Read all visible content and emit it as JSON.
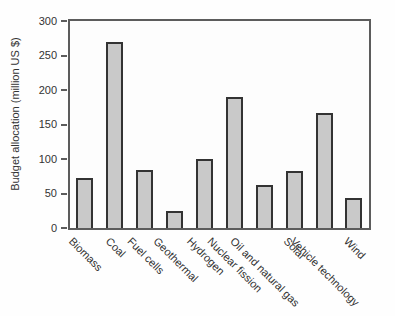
{
  "chart_data": {
    "type": "bar",
    "categories": [
      "Biomass",
      "Coal",
      "Fuel cells",
      "Geothermal",
      "Hydrogen",
      "Nuclear fission",
      "Oil and natural gas",
      "Solar",
      "Vehicle technology",
      "Wind"
    ],
    "values": [
      73,
      270,
      84,
      24,
      100,
      190,
      62,
      83,
      166,
      44
    ],
    "title": "",
    "xlabel": "",
    "ylabel": "Budget allocation (million US $)",
    "ylim": [
      0,
      300
    ],
    "yticks": [
      0,
      50,
      100,
      150,
      200,
      250,
      300
    ],
    "grid": false,
    "legend_position": "none",
    "bar_fill_color": "#c9c9c9",
    "bar_border_color": "#333333",
    "frame_color": "#5c5c5c",
    "text_color": "#333333",
    "background_color": "#fefefe"
  }
}
